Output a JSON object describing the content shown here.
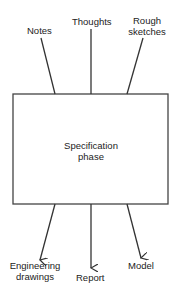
{
  "diagram": {
    "center": {
      "line1": "Specification",
      "line2": "phase"
    },
    "inputs": [
      {
        "label": "Notes"
      },
      {
        "label": "Thoughts"
      },
      {
        "label_line1": "Rough",
        "label_line2": "sketches"
      }
    ],
    "outputs": [
      {
        "label_line1": "Engineering",
        "label_line2": "drawings"
      },
      {
        "label": "Report"
      },
      {
        "label": "Model"
      }
    ],
    "colors": {
      "stroke": "#333333",
      "text": "#222222",
      "background": "#ffffff"
    }
  }
}
